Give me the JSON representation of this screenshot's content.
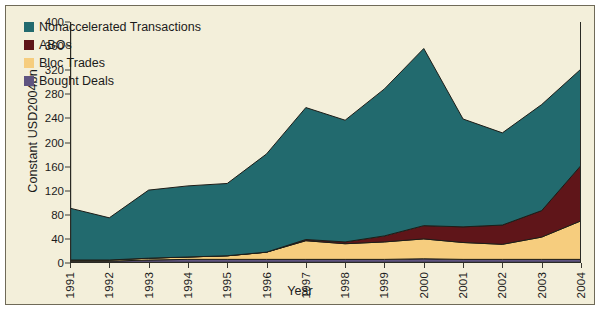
{
  "chart_data": {
    "type": "area",
    "stacked": true,
    "title": "",
    "xlabel": "Year",
    "ylabel": "Constant USD2004bn",
    "categories": [
      "1991",
      "1992",
      "1993",
      "1994",
      "1995",
      "1996",
      "1997",
      "1998",
      "1999",
      "2000",
      "2001",
      "2002",
      "2003",
      "2004"
    ],
    "x": [
      1991,
      1992,
      1993,
      1994,
      1995,
      1996,
      1997,
      1998,
      1999,
      2000,
      2001,
      2002,
      2003,
      2004
    ],
    "ylim": [
      0,
      400
    ],
    "yticks": [
      0,
      40,
      80,
      120,
      160,
      200,
      240,
      280,
      320,
      360,
      400
    ],
    "grid": false,
    "legend_position": "top-left",
    "series": [
      {
        "name": "Bought Deals",
        "color": "#5f5480",
        "values": [
          3,
          3,
          5,
          6,
          6,
          6,
          6,
          6,
          6,
          7,
          6,
          6,
          6,
          6
        ]
      },
      {
        "name": "Bloc Trades",
        "color": "#f6cd7e",
        "values": [
          2,
          2,
          3,
          4,
          6,
          12,
          31,
          26,
          29,
          33,
          28,
          25,
          37,
          64
        ]
      },
      {
        "name": "ABOs",
        "color": "#5f1519",
        "values": [
          0,
          0,
          0,
          0,
          0,
          0,
          2,
          3,
          10,
          22,
          26,
          32,
          44,
          92
        ]
      },
      {
        "name": "Nonaccelerated Transactions",
        "color": "#226a6e",
        "values": [
          86,
          70,
          113,
          118,
          120,
          163,
          219,
          202,
          244,
          294,
          179,
          153,
          176,
          160
        ]
      }
    ],
    "totals": [
      91,
      75,
      121,
      128,
      132,
      181,
      258,
      237,
      289,
      356,
      239,
      216,
      263,
      322
    ]
  },
  "legend": {
    "items": [
      {
        "label": "Nonaccelerated Transactions",
        "color": "#226a6e"
      },
      {
        "label": "ABOs",
        "color": "#5f1519"
      },
      {
        "label": "Bloc Trades",
        "color": "#f6cd7e"
      },
      {
        "label": "Bought Deals",
        "color": "#5f5480"
      }
    ]
  },
  "colors": {
    "background": "#f3efda",
    "frame": "#6f6a58",
    "axis": "#2a2a24",
    "text": "#1b1b1b"
  }
}
